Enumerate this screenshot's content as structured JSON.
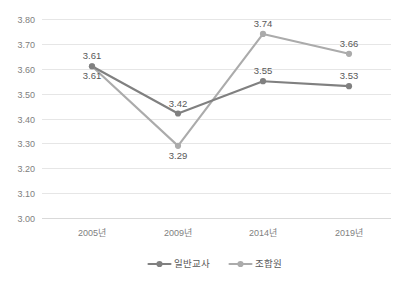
{
  "chart_data": {
    "type": "line",
    "title": "",
    "subtitle": "",
    "xlabel": "",
    "ylabel": "",
    "categories": [
      "2005년",
      "2009년",
      "2014년",
      "2019년"
    ],
    "series": [
      {
        "name": "일반교사",
        "color": "#808080",
        "values": [
          3.61,
          3.42,
          3.55,
          3.53
        ],
        "value_labels": [
          "3.61",
          "3.42",
          "3.55",
          "3.53"
        ],
        "label_position": [
          "below",
          "above",
          "above",
          "above"
        ],
        "marker": "circle"
      },
      {
        "name": "조합원",
        "color": "#ABABAB",
        "values": [
          3.61,
          3.29,
          3.74,
          3.66
        ],
        "value_labels": [
          "3.61",
          "3.29",
          "3.74",
          "3.66"
        ],
        "label_position": [
          "above",
          "below",
          "above",
          "above"
        ],
        "marker": "circle"
      }
    ],
    "ylim": [
      3.0,
      3.8
    ],
    "ytick_step": 0.1,
    "ytick_labels": [
      "3.80",
      "3.70",
      "3.60",
      "3.50",
      "3.40",
      "3.30",
      "3.20",
      "3.10",
      "3.00"
    ],
    "ytick_values": [
      3.8,
      3.7,
      3.6,
      3.5,
      3.4,
      3.3,
      3.2,
      3.1,
      3.0
    ],
    "grid": true,
    "grid_color": "#E6E6E6",
    "axis_color": "#D9D9D9",
    "legend_position": "bottom",
    "background": "#FFFFFF"
  },
  "legend": {
    "entries": [
      {
        "label": "일반교사",
        "color": "#808080"
      },
      {
        "label": "조합원",
        "color": "#ABABAB"
      }
    ]
  }
}
